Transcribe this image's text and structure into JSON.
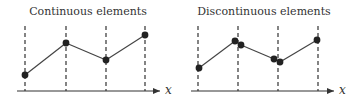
{
  "panels": [
    {
      "title": "Continuous elements",
      "axis_label": "x",
      "title_pos": [
        88,
        15
      ],
      "axis": {
        "x1": 17,
        "x2": 160,
        "y": 91,
        "label_x": 165
      },
      "dashed_lines": [
        25,
        66,
        106,
        145
      ],
      "dash_top": 26,
      "segments": [
        [
          [
            25,
            75
          ],
          [
            66,
            43
          ]
        ],
        [
          [
            66,
            43
          ],
          [
            106,
            60
          ]
        ],
        [
          [
            106,
            60
          ],
          [
            145,
            35
          ]
        ]
      ],
      "nodes": [
        [
          25,
          75
        ],
        [
          66,
          43
        ],
        [
          106,
          60
        ],
        [
          145,
          35
        ]
      ]
    },
    {
      "title": "Discontinuous elements",
      "axis_label": "x",
      "title_pos": [
        264,
        15
      ],
      "axis": {
        "x1": 191,
        "x2": 334,
        "y": 91,
        "label_x": 339
      },
      "dashed_lines": [
        198,
        238,
        278,
        318
      ],
      "dash_top": 26,
      "segments": [
        [
          [
            199,
            68
          ],
          [
            235,
            41
          ]
        ],
        [
          [
            241,
            45
          ],
          [
            274,
            59
          ]
        ],
        [
          [
            280,
            62
          ],
          [
            317,
            40
          ]
        ]
      ],
      "nodes": [
        [
          199,
          68
        ],
        [
          235,
          41
        ],
        [
          241,
          45
        ],
        [
          274,
          59
        ],
        [
          280,
          62
        ],
        [
          317,
          40
        ]
      ]
    }
  ],
  "colors": {
    "ink": "#333333",
    "node": "#222222"
  }
}
